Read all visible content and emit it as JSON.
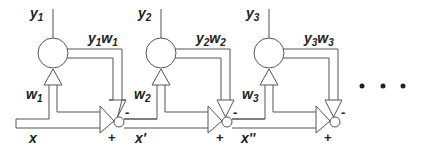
{
  "diagram": {
    "type": "cascade of adaptive units (Hebbian / anti-Hebbian deflation)",
    "stroke_color": "#555555",
    "text_color": "#222222",
    "stages": [
      {
        "output_label": "y",
        "output_sub": "1",
        "feedback_label_a": "y",
        "feedback_sub_a": "1",
        "feedback_label_b": "w",
        "feedback_sub_b": "1",
        "weight_label": "w",
        "weight_sub": "1",
        "input_label": "x",
        "plus_sign": "+",
        "minus_sign": "-"
      },
      {
        "output_label": "y",
        "output_sub": "2",
        "feedback_label_a": "y",
        "feedback_sub_a": "2",
        "feedback_label_b": "w",
        "feedback_sub_b": "2",
        "weight_label": "w",
        "weight_sub": "2",
        "input_label": "x'",
        "plus_sign": "+",
        "minus_sign": "-"
      },
      {
        "output_label": "y",
        "output_sub": "3",
        "feedback_label_a": "y",
        "feedback_sub_a": "3",
        "feedback_label_b": "w",
        "feedback_sub_b": "3",
        "weight_label": "w",
        "weight_sub": "3",
        "input_label": "x''",
        "plus_sign": "+",
        "minus_sign": "-"
      }
    ],
    "continuation": "ellipsis-dots"
  }
}
